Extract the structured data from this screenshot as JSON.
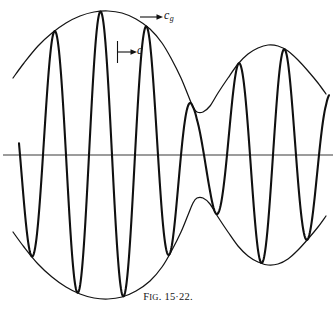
{
  "figure": {
    "caption_prefix": "F",
    "caption_smallcaps": "IG",
    "caption_number": ". 15·22.",
    "caption_full": "Fig. 15·22.",
    "labels": {
      "group_velocity": "c",
      "group_velocity_subscript": "g",
      "phase_velocity": "c"
    },
    "colors": {
      "ink": "#111111",
      "background": "#ffffff",
      "axis": "#3a3a3a"
    }
  },
  "chart_data": {
    "type": "line",
    "title": "Fig. 15·22.",
    "xlabel": "",
    "ylabel": "",
    "grid": false,
    "legend_position": "inline-annotations",
    "annotations": [
      {
        "text": "c_g",
        "meaning": "group velocity of the envelope",
        "arrow": "right",
        "arrow_x_start": 140,
        "arrow_x_end": 162,
        "arrow_y": 17,
        "label_x": 164,
        "label_y": 15
      },
      {
        "text": "c",
        "meaning": "phase velocity of the carrier wave",
        "arrow": "right",
        "arrow_x_start": 117,
        "arrow_x_end": 136,
        "arrow_y": 52,
        "tick_x": 117,
        "tick_y_top": 41,
        "tick_y_bottom": 63,
        "label_x": 137,
        "label_y": 50
      }
    ],
    "axis": {
      "baseline_y": 155,
      "x_start": 3,
      "x_end": 333
    },
    "geometry": {
      "x_min": 13,
      "x_max": 331,
      "carrier_half_period_px": 23,
      "carrier_zero_crossings": [
        20,
        43,
        67,
        90,
        113,
        136,
        159,
        182,
        205,
        228,
        251,
        274,
        297,
        320
      ],
      "envelope_amplitude_max_px": 144,
      "envelope_node_x": 197,
      "envelope_node_amplitude_px": 44,
      "envelope_peak_left_x": 108,
      "envelope_peak_right_x": 271,
      "envelope_peak_right_amplitude_px": 110
    },
    "series": [
      {
        "name": "envelope-upper",
        "role": "group-velocity envelope (c_g), upper",
        "points": [
          [
            13,
            78
          ],
          [
            24,
            63
          ],
          [
            38,
            46
          ],
          [
            52,
            33
          ],
          [
            66,
            23
          ],
          [
            80,
            16
          ],
          [
            94,
            12
          ],
          [
            108,
            11
          ],
          [
            122,
            13
          ],
          [
            136,
            19
          ],
          [
            150,
            29
          ],
          [
            162,
            43
          ],
          [
            172,
            60
          ],
          [
            181,
            78
          ],
          [
            188,
            95
          ],
          [
            193,
            107
          ],
          [
            197,
            112
          ],
          [
            203,
            112
          ],
          [
            210,
            106
          ],
          [
            218,
            93
          ],
          [
            228,
            78
          ],
          [
            238,
            64
          ],
          [
            248,
            54
          ],
          [
            258,
            48
          ],
          [
            268,
            45
          ],
          [
            278,
            46
          ],
          [
            288,
            51
          ],
          [
            298,
            60
          ],
          [
            308,
            71
          ],
          [
            318,
            83
          ],
          [
            326,
            94
          ]
        ]
      },
      {
        "name": "envelope-lower",
        "role": "group-velocity envelope (c_g), lower",
        "points": [
          [
            13,
            232
          ],
          [
            24,
            247
          ],
          [
            38,
            264
          ],
          [
            52,
            277
          ],
          [
            66,
            287
          ],
          [
            80,
            294
          ],
          [
            94,
            298
          ],
          [
            108,
            299
          ],
          [
            122,
            297
          ],
          [
            136,
            291
          ],
          [
            150,
            281
          ],
          [
            162,
            267
          ],
          [
            172,
            250
          ],
          [
            181,
            232
          ],
          [
            188,
            215
          ],
          [
            193,
            203
          ],
          [
            197,
            198
          ],
          [
            203,
            198
          ],
          [
            210,
            204
          ],
          [
            218,
            217
          ],
          [
            228,
            232
          ],
          [
            238,
            246
          ],
          [
            248,
            256
          ],
          [
            258,
            262
          ],
          [
            268,
            265
          ],
          [
            278,
            264
          ],
          [
            288,
            259
          ],
          [
            298,
            250
          ],
          [
            308,
            239
          ],
          [
            318,
            227
          ],
          [
            326,
            216
          ]
        ]
      },
      {
        "name": "carrier",
        "role": "phase velocity wave (c), modulated by envelope",
        "description": "Sinusoidal carrier of half-period 23 px whose amplitude follows the envelope; truncated at both ends.",
        "start_x": 19,
        "end_x": 329,
        "start_value_px_from_axis": -37,
        "end_value_px_from_axis": 60
      }
    ]
  }
}
